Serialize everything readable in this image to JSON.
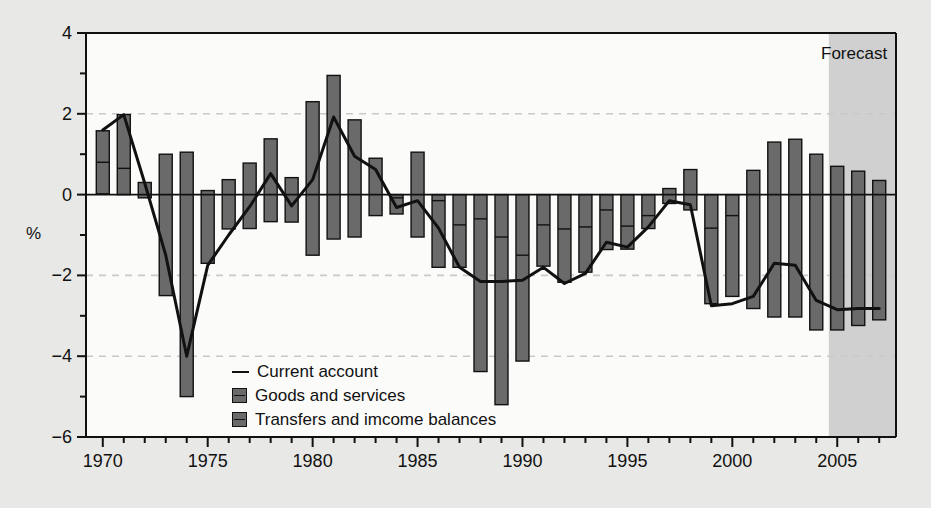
{
  "chart_data": {
    "type": "bar",
    "title": "",
    "subtitle": "",
    "xlabel": "",
    "ylabel": "%",
    "ylim": [
      -6,
      4
    ],
    "xlim": [
      1969.2,
      2007.8
    ],
    "yticks": [
      "4",
      "2",
      "0",
      "-2",
      "-4",
      "-6"
    ],
    "ytick_values": [
      4,
      2,
      0,
      -2,
      -4,
      -6
    ],
    "yminor_values": [
      3,
      1,
      -1,
      -3,
      -5
    ],
    "xticks": [
      "1970",
      "1975",
      "1980",
      "1985",
      "1990",
      "1995",
      "2000",
      "2005"
    ],
    "xtick_values": [
      1970,
      1975,
      1980,
      1985,
      1990,
      1995,
      2000,
      2005
    ],
    "grid": "horizontal dashed at 2, -2, -4",
    "gridlines": [
      2,
      -2,
      -4
    ],
    "legend_position": "inside lower-left",
    "stacked": true,
    "annotations": [
      {
        "text": "Forecast",
        "x": 2006.2,
        "y": 3.45,
        "region_start": 2004.6,
        "region_end": 2007.8
      }
    ],
    "categories": [
      1970,
      1971,
      1972,
      1973,
      1974,
      1975,
      1976,
      1977,
      1978,
      1979,
      1980,
      1981,
      1982,
      1983,
      1984,
      1985,
      1986,
      1987,
      1988,
      1989,
      1990,
      1991,
      1992,
      1993,
      1994,
      1995,
      1996,
      1997,
      1998,
      1999,
      2000,
      2001,
      2002,
      2003,
      2004,
      2005,
      2006,
      2007
    ],
    "series": [
      {
        "name": "Goods and services",
        "color": "#6a6a6a",
        "values": [
          0.8,
          1.33,
          0.3,
          1.0,
          1.05,
          0.1,
          0.37,
          0.78,
          1.38,
          0.42,
          2.3,
          2.95,
          1.85,
          0.9,
          -0.08,
          1.05,
          -0.15,
          -0.75,
          -0.6,
          -1.05,
          -1.5,
          -0.75,
          -0.85,
          -0.8,
          -0.38,
          -0.78,
          -0.52,
          0.15,
          0.62,
          -0.83,
          -0.52,
          0.6,
          1.3,
          1.37,
          1.0,
          0.7,
          0.58,
          0.35
        ]
      },
      {
        "name": "Transfers and imcome balances",
        "color": "#6a6a6a",
        "values": [
          0.78,
          0.65,
          -0.38,
          -3.5,
          -6.05,
          -1.8,
          -1.22,
          -1.62,
          -2.05,
          -1.1,
          -3.8,
          -4.05,
          -2.9,
          -1.42,
          -0.4,
          -2.1,
          -1.65,
          -1.05,
          -3.78,
          -4.15,
          -2.62,
          -1.02,
          -1.32,
          -1.12,
          -0.98,
          -0.57,
          -0.32,
          -0.37,
          -1.0,
          -1.87,
          -2.0,
          -3.42,
          -4.33,
          -4.4,
          -4.35,
          -4.05,
          -3.82,
          -3.45
        ]
      }
    ],
    "bar_segments": [
      {
        "year": 1970,
        "upper": 1.58,
        "mid": 0.8,
        "lower": 0.02
      },
      {
        "year": 1971,
        "upper": 1.98,
        "mid": 0.65,
        "lower": 0.0
      },
      {
        "year": 1972,
        "upper": 0.3,
        "mid": 0.3,
        "lower": -0.08
      },
      {
        "year": 1973,
        "upper": 1.0,
        "mid": 1.0,
        "lower": -2.5
      },
      {
        "year": 1974,
        "upper": 1.05,
        "mid": 1.05,
        "lower": -5.0
      },
      {
        "year": 1975,
        "upper": 0.1,
        "mid": 0.1,
        "lower": -1.7
      },
      {
        "year": 1976,
        "upper": 0.37,
        "mid": 0.37,
        "lower": -0.85
      },
      {
        "year": 1977,
        "upper": 0.78,
        "mid": 0.78,
        "lower": -0.84
      },
      {
        "year": 1978,
        "upper": 1.38,
        "mid": 1.38,
        "lower": -0.67
      },
      {
        "year": 1979,
        "upper": 0.42,
        "mid": 0.42,
        "lower": -0.68
      },
      {
        "year": 1980,
        "upper": 2.3,
        "mid": 2.3,
        "lower": -1.5
      },
      {
        "year": 1981,
        "upper": 2.95,
        "mid": 2.95,
        "lower": -1.1
      },
      {
        "year": 1982,
        "upper": 1.85,
        "mid": 1.85,
        "lower": -1.05
      },
      {
        "year": 1983,
        "upper": 0.9,
        "mid": 0.9,
        "lower": -0.52
      },
      {
        "year": 1984,
        "upper": 0.0,
        "mid": -0.08,
        "lower": -0.48
      },
      {
        "year": 1985,
        "upper": 1.05,
        "mid": 1.05,
        "lower": -1.05
      },
      {
        "year": 1986,
        "upper": 0.0,
        "mid": -0.15,
        "lower": -1.8
      },
      {
        "year": 1987,
        "upper": 0.0,
        "mid": -0.75,
        "lower": -1.8
      },
      {
        "year": 1988,
        "upper": 0.0,
        "mid": -0.6,
        "lower": -4.38
      },
      {
        "year": 1989,
        "upper": 0.0,
        "mid": -1.05,
        "lower": -5.2
      },
      {
        "year": 1990,
        "upper": 0.0,
        "mid": -1.5,
        "lower": -4.12
      },
      {
        "year": 1991,
        "upper": 0.0,
        "mid": -0.75,
        "lower": -1.77
      },
      {
        "year": 1992,
        "upper": 0.0,
        "mid": -0.85,
        "lower": -2.17
      },
      {
        "year": 1993,
        "upper": 0.0,
        "mid": -0.8,
        "lower": -1.92
      },
      {
        "year": 1994,
        "upper": 0.0,
        "mid": -0.38,
        "lower": -1.36
      },
      {
        "year": 1995,
        "upper": 0.0,
        "mid": -0.78,
        "lower": -1.35
      },
      {
        "year": 1996,
        "upper": 0.0,
        "mid": -0.52,
        "lower": -0.84
      },
      {
        "year": 1997,
        "upper": 0.15,
        "mid": 0.15,
        "lower": -0.22
      },
      {
        "year": 1998,
        "upper": 0.62,
        "mid": 0.62,
        "lower": -0.38
      },
      {
        "year": 1999,
        "upper": 0.0,
        "mid": -0.83,
        "lower": -2.7
      },
      {
        "year": 2000,
        "upper": 0.0,
        "mid": -0.52,
        "lower": -2.52
      },
      {
        "year": 2001,
        "upper": 0.6,
        "mid": 0.6,
        "lower": -2.82
      },
      {
        "year": 2002,
        "upper": 1.3,
        "mid": 1.3,
        "lower": -3.03
      },
      {
        "year": 2003,
        "upper": 1.37,
        "mid": 1.37,
        "lower": -3.03
      },
      {
        "year": 2004,
        "upper": 1.0,
        "mid": 1.0,
        "lower": -3.35
      },
      {
        "year": 2005,
        "upper": 0.7,
        "mid": 0.7,
        "lower": -3.35
      },
      {
        "year": 2006,
        "upper": 0.58,
        "mid": 0.58,
        "lower": -3.24
      },
      {
        "year": 2007,
        "upper": 0.35,
        "mid": 0.35,
        "lower": -3.1
      }
    ],
    "line_series": {
      "name": "Current account",
      "color": "#111111",
      "x": [
        1970,
        1971,
        1972,
        1973,
        1974,
        1975,
        1976,
        1977,
        1978,
        1979,
        1980,
        1981,
        1982,
        1983,
        1984,
        1985,
        1986,
        1987,
        1988,
        1989,
        1990,
        1991,
        1992,
        1993,
        1994,
        1995,
        1996,
        1997,
        1998,
        1999,
        2000,
        2001,
        2002,
        2003,
        2004,
        2005,
        2006,
        2007
      ],
      "y": [
        1.6,
        1.98,
        0.28,
        -1.5,
        -4.0,
        -1.75,
        -1.0,
        -0.3,
        0.52,
        -0.28,
        0.37,
        1.92,
        0.95,
        0.62,
        -0.32,
        -0.15,
        -0.83,
        -1.8,
        -2.15,
        -2.15,
        -2.12,
        -1.8,
        -2.2,
        -1.95,
        -1.18,
        -1.3,
        -0.8,
        -0.15,
        -0.25,
        -2.75,
        -2.7,
        -2.52,
        -1.7,
        -1.75,
        -2.62,
        -2.85,
        -2.82,
        -2.82
      ]
    }
  },
  "legend": {
    "items": [
      {
        "label": "Current account",
        "marker": "line"
      },
      {
        "label": "Goods and services",
        "marker": "box"
      },
      {
        "label": "Transfers and imcome balances",
        "marker": "box"
      }
    ]
  },
  "colors": {
    "background": "#e8e8e6",
    "plot_background": "#fbfbfa",
    "bar_fill": "#6a6a6a",
    "bar_edge": "#111111",
    "line": "#111111",
    "grid": "#c9c9c9",
    "forecast_shade": "#c8c8c8",
    "axis": "#111111"
  }
}
